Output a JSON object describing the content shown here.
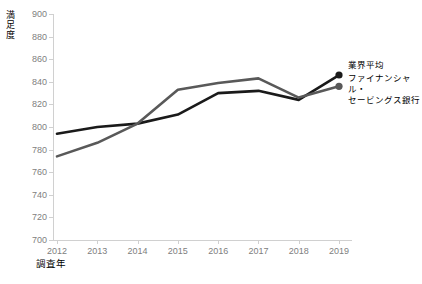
{
  "chart_data": {
    "type": "line",
    "title": "",
    "xlabel": "調査年",
    "ylabel": "満足度",
    "categories": [
      "2012",
      "2013",
      "2014",
      "2015",
      "2016",
      "2017",
      "2018",
      "2019"
    ],
    "x": [
      2012,
      2013,
      2014,
      2015,
      2016,
      2017,
      2018,
      2019
    ],
    "ylim": [
      700,
      900
    ],
    "yticks": [
      700,
      720,
      740,
      760,
      780,
      800,
      820,
      840,
      860,
      880,
      900
    ],
    "grid": false,
    "legend_position": "right-inside",
    "series": [
      {
        "name": "業界平均",
        "color": "#1a1a1a",
        "marker_last": true,
        "values": [
          794,
          800,
          803,
          811,
          830,
          832,
          824,
          846
        ]
      },
      {
        "name": "ファイナンシャル・セービングス銀行",
        "color": "#595959",
        "marker_last": true,
        "values": [
          774,
          786,
          803,
          833,
          839,
          843,
          826,
          836
        ]
      }
    ],
    "legend": [
      {
        "label": "業界平均",
        "color": "#1a1a1a"
      },
      {
        "label": "ファイナンシャル・セービングス銀行",
        "color": "#595959"
      }
    ]
  },
  "axis": {
    "y_title_chars": [
      "満",
      "足",
      "度"
    ],
    "x_title": "調査年"
  },
  "legend_lines": {
    "series1": "業界平均",
    "series2_line1": "ファイナンシャル・",
    "series2_line2": "セービングス銀行"
  }
}
